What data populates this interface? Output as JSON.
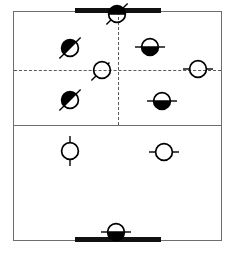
{
  "diagram": {
    "court": {
      "x": 13,
      "y": 11,
      "width": 209,
      "height": 230,
      "border_color": "#6e6e6e",
      "background": "#ffffff"
    },
    "lines": [
      {
        "name": "midline",
        "type": "solid",
        "orientation": "horizontal",
        "y": 125,
        "x1": 13,
        "x2": 222,
        "color": "#6e6e6e"
      },
      {
        "name": "center-vertical",
        "type": "dashed",
        "orientation": "vertical",
        "x": 118,
        "y1": 12,
        "y2": 125,
        "color": "#58595b"
      },
      {
        "name": "center-horizontal",
        "type": "dashed",
        "orientation": "horizontal",
        "y": 70,
        "x1": 14,
        "x2": 221,
        "color": "#58595b"
      }
    ],
    "goal_bars": [
      {
        "name": "top-goal-bar",
        "x": 75,
        "y": 8,
        "width": 86,
        "height": 5,
        "color": "#111111"
      },
      {
        "name": "bottom-goal-bar",
        "x": 75,
        "y": 237,
        "width": 86,
        "height": 5,
        "color": "#111111"
      }
    ],
    "legend": {
      "filled_label": "filled token",
      "open_label": "open token",
      "fill_color": "#000000",
      "stroke_color": "#000000"
    },
    "tokens": [
      {
        "id": "t1",
        "name": "token-top-goal",
        "x": 117,
        "y": 14,
        "fill": "top",
        "tick": "diagonal-both",
        "group": "filled",
        "zone": "top-goal"
      },
      {
        "id": "t2",
        "name": "token-upper-left",
        "x": 70,
        "y": 48,
        "fill": "diag",
        "tick": "diagonal-both",
        "group": "filled",
        "zone": "upper-left"
      },
      {
        "id": "t3",
        "name": "token-upper-right",
        "x": 150,
        "y": 47,
        "fill": "bottom",
        "tick": "horizontal-both",
        "group": "filled",
        "zone": "upper-right"
      },
      {
        "id": "t4",
        "name": "token-center-left",
        "x": 102,
        "y": 70,
        "fill": "none",
        "tick": "diagonal-left",
        "group": "open",
        "zone": "center-left"
      },
      {
        "id": "t5",
        "name": "token-center-right",
        "x": 198,
        "y": 69,
        "fill": "none",
        "tick": "horizontal-both",
        "group": "open",
        "zone": "center-right"
      },
      {
        "id": "t6",
        "name": "token-lower-left",
        "x": 70,
        "y": 100,
        "fill": "diag",
        "tick": "diagonal-both",
        "group": "filled",
        "zone": "mid-left"
      },
      {
        "id": "t7",
        "name": "token-lower-right",
        "x": 162,
        "y": 101,
        "fill": "bottom",
        "tick": "horizontal-both",
        "group": "filled",
        "zone": "mid-right"
      },
      {
        "id": "t8",
        "name": "token-back-left",
        "x": 70,
        "y": 151,
        "fill": "none",
        "tick": "vertical-both",
        "group": "open",
        "zone": "back-left"
      },
      {
        "id": "t9",
        "name": "token-back-right",
        "x": 164,
        "y": 152,
        "fill": "none",
        "tick": "horizontal-both",
        "group": "open",
        "zone": "back-right"
      },
      {
        "id": "t10",
        "name": "token-bottom-goal",
        "x": 116,
        "y": 232,
        "fill": "bottom",
        "tick": "horizontal-both",
        "group": "filled",
        "zone": "bottom-goal"
      }
    ]
  }
}
